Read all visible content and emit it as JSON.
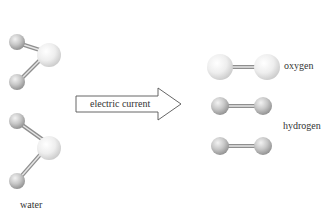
{
  "diagram": {
    "reactant": {
      "label": "water",
      "molecule_count": 2
    },
    "arrow": {
      "label": "electric current"
    },
    "products": [
      {
        "label": "oxygen",
        "molecule_count": 1
      },
      {
        "label": "hydrogen",
        "molecule_count": 2
      }
    ],
    "colors": {
      "atom_light": "#f4f4f4",
      "atom_mid": "#d4d4d4",
      "atom_dark": "#a8a8a8",
      "bond": "#9a9a9a",
      "arrow_stroke": "#555555",
      "text": "#333333"
    }
  }
}
